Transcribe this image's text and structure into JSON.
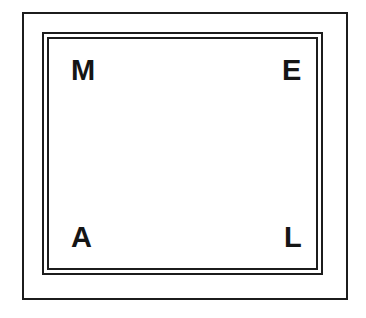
{
  "figure": {
    "kind": "nested-rectangular-frame-diagram",
    "canvas": {
      "width": 366,
      "height": 318,
      "background_color": "#ffffff"
    },
    "line_color": "#1c1c1c",
    "frames": [
      {
        "name": "outer-frame",
        "style": "single-line",
        "x": 22,
        "y": 12,
        "width": 326,
        "height": 288,
        "stroke_width": 2
      },
      {
        "name": "inner-frame-outer",
        "style": "double-line-outer-ring",
        "x": 42,
        "y": 32,
        "width": 281,
        "height": 243,
        "stroke_width": 2
      },
      {
        "name": "inner-frame-inner",
        "style": "double-line-inner-ring",
        "x": 47,
        "y": 37,
        "width": 271,
        "height": 233,
        "stroke_width": 2
      }
    ],
    "corner_labels": [
      {
        "position": "top-left",
        "text": "M",
        "x": 71,
        "y": 56
      },
      {
        "position": "top-right",
        "text": "E",
        "x": 282,
        "y": 56
      },
      {
        "position": "bottom-left",
        "text": "A",
        "x": 71,
        "y": 223
      },
      {
        "position": "bottom-right",
        "text": "L",
        "x": 284,
        "y": 223
      }
    ],
    "label_text_color": "#151515"
  }
}
